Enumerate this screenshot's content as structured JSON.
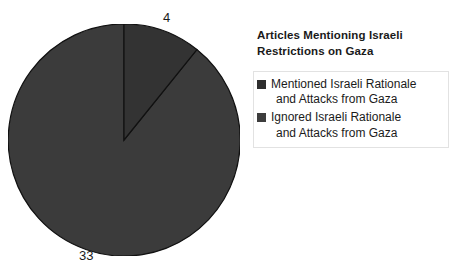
{
  "chart_data": {
    "type": "pie",
    "title": "Articles Mentioning Israeli Restrictions on Gaza",
    "title_lines": [
      "Articles Mentioning Israeli",
      "Restrictions on Gaza"
    ],
    "categories": [
      "Mentioned Israeli Rationale and Attacks from Gaza",
      "Ignored Israeli Rationale and Attacks from Gaza"
    ],
    "values": [
      4,
      33
    ],
    "total": 37,
    "data_labels": [
      "4",
      "33"
    ],
    "colors": [
      "#333333",
      "#3b3b3b"
    ],
    "start_angle_deg": 0,
    "direction": "clockwise",
    "legend_position": "right",
    "grid": false,
    "xlabel": "",
    "ylabel": ""
  },
  "pie": {
    "slices": [
      {
        "name": "Mentioned Israeli Rationale and Attacks from Gaza",
        "value": 4,
        "label": "4",
        "color": "#333333",
        "path": "M 116 116 L 116 0 A 116 116 0 0 1 188.85 25.54 Z"
      },
      {
        "name": "Ignored Israeli Rationale and Attacks from Gaza",
        "value": 33,
        "label": "33",
        "color": "#3b3b3b",
        "path": "M 116 116 L 188.85 25.54 A 116 116 0 1 1 116 0 Z"
      }
    ],
    "outline_color": "#111111"
  },
  "legend": {
    "title_line_1": "Articles Mentioning Israeli",
    "title_line_2": "Restrictions on Gaza",
    "items": [
      {
        "label_line_1": "Mentioned Israeli Rationale",
        "label_line_2": "and Attacks from Gaza",
        "swatch_color": "#2e2e2e"
      },
      {
        "label_line_1": "Ignored Israeli Rationale",
        "label_line_2": "and Attacks from Gaza",
        "swatch_color": "#3d3d3d"
      }
    ]
  }
}
